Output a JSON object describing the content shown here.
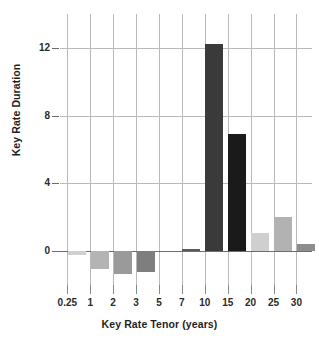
{
  "chart_data": {
    "type": "bar",
    "title": "",
    "xlabel": "Key Rate Tenor (years)",
    "ylabel": "Key Rate Duration",
    "categories": [
      "0.25",
      "1",
      "2",
      "3",
      "5",
      "7",
      "10",
      "15",
      "20",
      "25",
      "30"
    ],
    "values": [
      -0.25,
      -1.05,
      -1.35,
      -1.25,
      0.0,
      0.15,
      12.2,
      6.9,
      1.05,
      2.0,
      0.4
    ],
    "bar_colors": [
      "#d0d0d0",
      "#b4b4b4",
      "#9a9a9a",
      "#7e7e7e",
      "#ffffff",
      "#5a5a5a",
      "#3a3a3a",
      "#1a1a1a",
      "#cfcfcf",
      "#b2b2b2",
      "#8d8d8d"
    ],
    "ytick_labels": [
      "0",
      "4",
      "8",
      "12"
    ],
    "ytick_values": [
      0,
      4,
      8,
      12
    ],
    "ylim": [
      -2.0,
      14.0
    ],
    "grid": "both",
    "legend": "none"
  },
  "axes": {
    "y_title": "Key Rate Duration",
    "x_title": "Key Rate Tenor (years)"
  },
  "colors": {
    "background": "#ffffff",
    "gridline": "#b9b9b9",
    "axis": "#6d6d6d",
    "text": "#1f1f1f"
  }
}
